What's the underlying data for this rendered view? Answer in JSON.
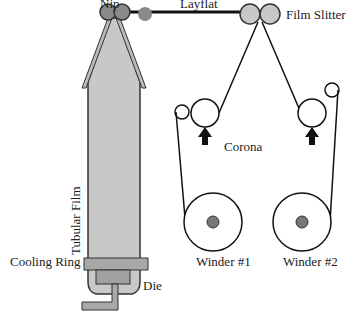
{
  "diagram": {
    "labels": {
      "nip": "Nip",
      "layflat": "Layflat",
      "film_slitter": "Film Slitter",
      "corona": "Corona",
      "tubular_film": "Tubular Film",
      "cooling_ring": "Cooling Ring",
      "die": "Die",
      "winder1": "Winder #1",
      "winder2": "Winder #2"
    },
    "colors": {
      "film_fill": "#c8c8c8",
      "roller_dark": "#8a8a8a",
      "die_fill": "#a8a8a8",
      "line": "#111111"
    }
  }
}
